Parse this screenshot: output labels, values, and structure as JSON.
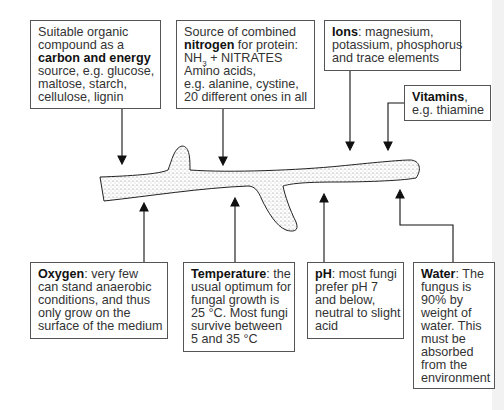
{
  "boxes": {
    "carbon": {
      "lines": [
        "Suitable organic",
        "compound as a"
      ],
      "bold": "carbon and energy",
      "rest": [
        "source, e.g. glucose,",
        "maltose, starch,",
        "cellulose, lignin"
      ]
    },
    "nitrogen": {
      "line1": "Source of combined",
      "bold": "nitrogen",
      "line2_rest": " for protein:",
      "nh": "NH",
      "nh_sub": "3",
      "nh_rest": " + NITRATES",
      "rest": [
        "Amino acids,",
        "e.g. alanine, cystine,",
        "20 different ones in all"
      ]
    },
    "ions": {
      "bold": "Ions",
      "line1_rest": ": magnesium,",
      "rest": [
        "potassium, phosphorus",
        "and trace elements"
      ]
    },
    "vitamins": {
      "bold": "Vitamins",
      "line1_rest": ",",
      "rest": [
        "e.g. thiamine"
      ]
    },
    "oxygen": {
      "bold": "Oxygen",
      "line1_rest": ": very few",
      "rest": [
        "can stand anaerobic",
        "conditions, and thus",
        "only grow on the",
        "surface of the medium"
      ]
    },
    "temperature": {
      "bold": "Temperature",
      "line1_rest": ": the",
      "rest": [
        "usual optimum for",
        "fungal growth is",
        "25 °C. Most fungi",
        "survive between",
        "5 and 35 °C"
      ]
    },
    "ph": {
      "bold": "pH",
      "line1_rest": ": most fungi",
      "rest": [
        "prefer pH 7",
        "and below,",
        "neutral to slight",
        "acid"
      ]
    },
    "water": {
      "bold": "Water",
      "line1_rest": ": The",
      "rest": [
        "fungus is",
        "90% by",
        "weight of",
        "water. This",
        "must be",
        "absorbed",
        "from the",
        "environment"
      ]
    }
  },
  "colors": {
    "line": "#111111",
    "border": "#555555",
    "stipple": "#8a8a8a"
  }
}
